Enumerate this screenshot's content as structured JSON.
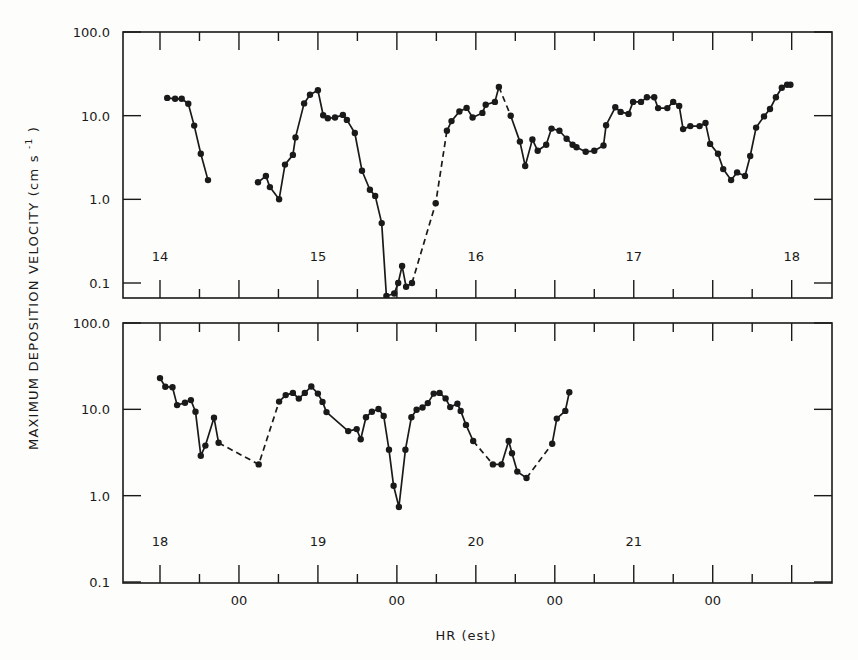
{
  "chart_data": [
    {
      "type": "line",
      "panel": "top",
      "ylabel": "MAXIMUM DEPOSITION VELOCITY (cm s^-1)",
      "yscale": "log",
      "ylim": [
        0.07,
        100.0
      ],
      "ytick_labels": [
        "100.0",
        "10.0",
        "1.0",
        "0.1"
      ],
      "ytick_values": [
        100.0,
        10.0,
        1.0,
        0.1
      ],
      "x_units": "hours from day 14 00:00 (EST)",
      "xlim": [
        6.2,
        114.0
      ],
      "day_labels": [
        {
          "text": "14",
          "hour": 12
        },
        {
          "text": "15",
          "hour": 36
        },
        {
          "text": "16",
          "hour": 60
        },
        {
          "text": "17",
          "hour": 84
        },
        {
          "text": "18",
          "hour": 108
        }
      ],
      "major_tick_hours": [
        12,
        24,
        36,
        48,
        60,
        72,
        84,
        96,
        108
      ],
      "minor_tick_hours": [
        18,
        30,
        42,
        54,
        66,
        78,
        90,
        102
      ],
      "segments": [
        {
          "style": "solid",
          "points": [
            [
              13.1,
              16.3
            ],
            [
              14.3,
              15.9
            ],
            [
              15.3,
              15.9
            ],
            [
              16.3,
              13.9
            ],
            [
              17.2,
              7.6
            ],
            [
              18.2,
              3.5
            ],
            [
              19.3,
              1.7
            ]
          ]
        },
        {
          "style": "solid",
          "points": [
            [
              26.9,
              1.6
            ],
            [
              28.1,
              1.9
            ],
            [
              28.7,
              1.4
            ],
            [
              30.1,
              1.0
            ],
            [
              31.0,
              2.6
            ],
            [
              32.2,
              3.4
            ],
            [
              32.6,
              5.5
            ],
            [
              33.9,
              14.0
            ],
            [
              34.8,
              17.8
            ],
            [
              36.0,
              20.1
            ],
            [
              36.8,
              10.1
            ],
            [
              37.5,
              9.3
            ],
            [
              38.6,
              9.5
            ],
            [
              39.8,
              10.2
            ],
            [
              40.4,
              8.9
            ],
            [
              41.6,
              6.2
            ],
            [
              42.7,
              2.2
            ],
            [
              43.9,
              1.3
            ],
            [
              44.7,
              1.1
            ],
            [
              45.7,
              0.52
            ],
            [
              46.4,
              0.07
            ],
            [
              47.6,
              0.075
            ],
            [
              48.2,
              0.1
            ],
            [
              48.8,
              0.16
            ],
            [
              49.4,
              0.09
            ],
            [
              50.3,
              0.1
            ]
          ]
        },
        {
          "style": "dashed",
          "points": [
            [
              50.3,
              0.1
            ],
            [
              53.9,
              0.9
            ],
            [
              55.6,
              6.6
            ]
          ]
        },
        {
          "style": "solid",
          "points": [
            [
              55.6,
              6.6
            ],
            [
              56.3,
              8.6
            ],
            [
              57.5,
              11.2
            ],
            [
              58.6,
              12.4
            ],
            [
              59.5,
              9.5
            ],
            [
              61.0,
              10.8
            ],
            [
              61.5,
              13.5
            ],
            [
              62.9,
              14.6
            ],
            [
              63.5,
              22.0
            ]
          ]
        },
        {
          "style": "dashed",
          "points": [
            [
              63.5,
              22.0
            ],
            [
              65.3,
              10.0
            ]
          ]
        },
        {
          "style": "solid",
          "points": [
            [
              65.3,
              10.0
            ],
            [
              66.7,
              4.9
            ],
            [
              67.5,
              2.5
            ],
            [
              68.6,
              5.2
            ],
            [
              69.4,
              3.8
            ],
            [
              70.7,
              4.5
            ],
            [
              71.5,
              7.0
            ],
            [
              72.7,
              6.6
            ],
            [
              73.8,
              5.3
            ],
            [
              74.7,
              4.5
            ],
            [
              75.3,
              4.2
            ],
            [
              76.7,
              3.7
            ],
            [
              78.0,
              3.8
            ],
            [
              79.4,
              4.4
            ],
            [
              79.8,
              7.7
            ],
            [
              81.2,
              12.6
            ],
            [
              82.0,
              11.1
            ],
            [
              83.2,
              10.5
            ],
            [
              83.9,
              14.6
            ],
            [
              85.1,
              14.6
            ],
            [
              86.0,
              16.6
            ],
            [
              87.1,
              16.6
            ],
            [
              87.7,
              12.3
            ],
            [
              89.1,
              12.3
            ],
            [
              90.0,
              14.6
            ],
            [
              90.9,
              13.1
            ],
            [
              91.5,
              6.9
            ],
            [
              92.6,
              7.5
            ],
            [
              94.0,
              7.5
            ],
            [
              94.9,
              8.2
            ],
            [
              95.6,
              4.6
            ],
            [
              96.8,
              3.5
            ],
            [
              97.6,
              2.3
            ],
            [
              98.8,
              1.7
            ],
            [
              99.7,
              2.1
            ],
            [
              100.9,
              1.9
            ],
            [
              101.7,
              3.3
            ],
            [
              102.6,
              7.2
            ],
            [
              103.8,
              9.8
            ],
            [
              104.7,
              12.0
            ],
            [
              105.6,
              16.6
            ],
            [
              106.5,
              21.6
            ],
            [
              107.3,
              23.4
            ],
            [
              107.8,
              23.4
            ]
          ]
        }
      ]
    },
    {
      "type": "line",
      "panel": "bottom",
      "ylabel": "MAXIMUM DEPOSITION VELOCITY (cm s^-1)",
      "xlabel": "HR (est)",
      "yscale": "log",
      "ylim": [
        0.1,
        100.0
      ],
      "ytick_labels": [
        "100.0",
        "10.0",
        "1.0",
        "0.1"
      ],
      "ytick_values": [
        100.0,
        10.0,
        1.0,
        0.1
      ],
      "x_units": "hours from day 18 00:00 (EST)",
      "xlim": [
        6.2,
        114.0
      ],
      "day_labels": [
        {
          "text": "18",
          "hour": 12
        },
        {
          "text": "19",
          "hour": 36
        },
        {
          "text": "20",
          "hour": 60
        },
        {
          "text": "21",
          "hour": 84
        }
      ],
      "midnight_labels": [
        {
          "text": "00",
          "hour": 24
        },
        {
          "text": "00",
          "hour": 48
        },
        {
          "text": "00",
          "hour": 72
        },
        {
          "text": "00",
          "hour": 96
        }
      ],
      "major_tick_hours": [
        12,
        24,
        36,
        48,
        60,
        72,
        84,
        96,
        108
      ],
      "minor_tick_hours": [
        18,
        30,
        42,
        54,
        66,
        78,
        90,
        102
      ],
      "segments": [
        {
          "style": "solid",
          "points": [
            [
              12.0,
              23.0
            ],
            [
              12.8,
              18.3
            ],
            [
              13.9,
              18.0
            ],
            [
              14.6,
              11.2
            ],
            [
              15.8,
              11.9
            ],
            [
              16.7,
              12.8
            ],
            [
              17.4,
              9.4
            ],
            [
              18.2,
              2.9
            ],
            [
              18.9,
              3.8
            ],
            [
              20.2,
              8.0
            ],
            [
              20.9,
              4.1
            ]
          ]
        },
        {
          "style": "dashed",
          "points": [
            [
              20.9,
              4.1
            ],
            [
              27.0,
              2.3
            ],
            [
              30.1,
              12.3
            ]
          ]
        },
        {
          "style": "solid",
          "points": [
            [
              30.1,
              12.3
            ],
            [
              31.1,
              14.6
            ],
            [
              32.2,
              15.5
            ],
            [
              33.1,
              13.3
            ],
            [
              34.0,
              15.5
            ],
            [
              35.0,
              18.4
            ],
            [
              36.0,
              15.2
            ],
            [
              36.7,
              12.2
            ],
            [
              37.3,
              9.3
            ],
            [
              40.6,
              5.6
            ],
            [
              41.9,
              5.9
            ],
            [
              42.5,
              4.5
            ],
            [
              43.3,
              8.1
            ],
            [
              44.2,
              9.4
            ],
            [
              45.2,
              10.1
            ],
            [
              46.0,
              8.4
            ],
            [
              46.8,
              3.4
            ],
            [
              47.5,
              1.3
            ],
            [
              48.3,
              0.74
            ],
            [
              49.3,
              3.4
            ],
            [
              50.2,
              8.1
            ],
            [
              51.0,
              9.9
            ],
            [
              51.9,
              10.5
            ],
            [
              52.7,
              11.8
            ],
            [
              53.6,
              15.2
            ],
            [
              54.5,
              15.5
            ],
            [
              55.4,
              13.4
            ],
            [
              56.1,
              10.6
            ],
            [
              57.2,
              11.6
            ],
            [
              57.7,
              9.6
            ],
            [
              58.5,
              6.6
            ],
            [
              59.6,
              4.3
            ]
          ]
        },
        {
          "style": "dashed",
          "points": [
            [
              59.6,
              4.3
            ],
            [
              62.6,
              2.3
            ]
          ]
        },
        {
          "style": "solid",
          "points": [
            [
              62.6,
              2.3
            ],
            [
              63.9,
              2.3
            ],
            [
              65.0,
              4.3
            ],
            [
              65.5,
              3.1
            ],
            [
              66.3,
              1.9
            ],
            [
              67.7,
              1.6
            ]
          ]
        },
        {
          "style": "dashed",
          "points": [
            [
              67.7,
              1.6
            ],
            [
              71.6,
              4.0
            ]
          ]
        },
        {
          "style": "solid",
          "points": [
            [
              71.6,
              4.0
            ],
            [
              72.3,
              7.8
            ],
            [
              73.6,
              9.6
            ],
            [
              74.2,
              15.8
            ]
          ]
        }
      ]
    }
  ],
  "axis": {
    "ylabel": "MAXIMUM DEPOSITION VELOCITY (cm s",
    "ylabel_sup": "-1",
    "ylabel_end": ")",
    "xlabel": "HR (est)",
    "ytick_labels": [
      "100.0",
      "10.0",
      "1.0",
      "0.1"
    ],
    "midnight_label": "00"
  },
  "colors": {
    "ink": "#1a1a1a",
    "paper": "#fdfdfb"
  }
}
